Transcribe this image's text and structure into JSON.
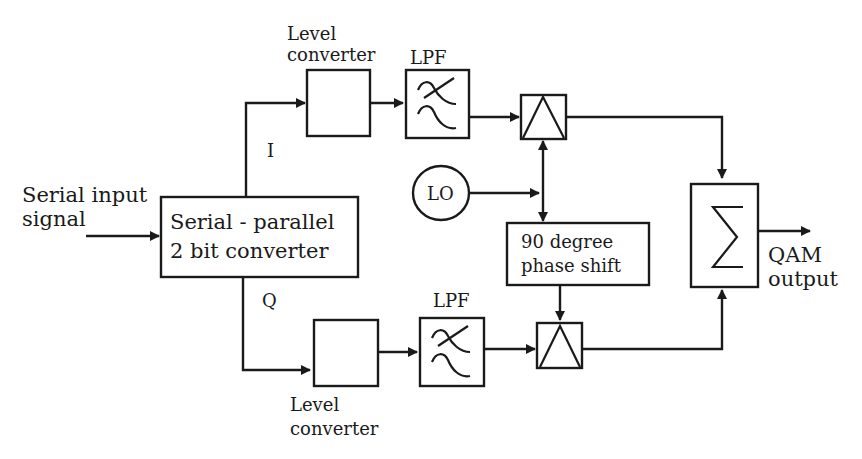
{
  "diagram": {
    "type": "block-diagram",
    "input": {
      "label_line1": "Serial input",
      "label_line2": "signal"
    },
    "serial_parallel": {
      "label_line1": "Serial - parallel",
      "label_line2": "2 bit converter"
    },
    "branch_i": {
      "label": "I",
      "level_converter": {
        "label_line1": "Level",
        "label_line2": "converter"
      },
      "lpf": {
        "label": "LPF"
      }
    },
    "branch_q": {
      "label": "Q",
      "level_converter": {
        "label_line1": "Level",
        "label_line2": "converter"
      },
      "lpf": {
        "label": "LPF"
      }
    },
    "oscillator": {
      "label": "LO"
    },
    "phase_shift": {
      "label_line1": "90 degree",
      "label_line2": "phase shift"
    },
    "summer": {
      "symbol": "Σ"
    },
    "output": {
      "label_line1": "QAM",
      "label_line2": "output"
    },
    "colors": {
      "line": "#1a1a1a",
      "background": "#ffffff"
    }
  }
}
